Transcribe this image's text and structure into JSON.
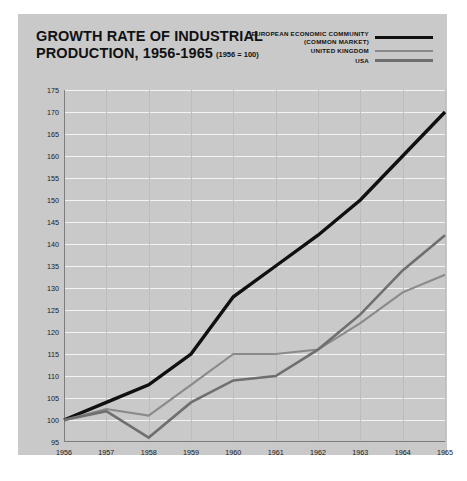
{
  "card": {
    "background": "#c9c9c9",
    "page_background": "#ffffff"
  },
  "title": {
    "line1": "GROWTH RATE OF INDUSTRIAL",
    "line2": "PRODUCTION, 1956-1965",
    "base_note": "(1956 = 100)"
  },
  "legend": {
    "position": "top-right",
    "items": [
      {
        "label": "EUROPEAN ECONOMIC COMMUNITY\n(COMMON MARKET)",
        "color": "#101010",
        "thickness": 3.4
      },
      {
        "label": "UNITED KINGDOM",
        "color": "#8a8a8a",
        "thickness": 2.1
      },
      {
        "label": "USA",
        "color": "#6f6f6f",
        "thickness": 2.6
      }
    ]
  },
  "axes": {
    "y_ticks": [
      175,
      170,
      165,
      160,
      155,
      150,
      145,
      140,
      135,
      130,
      125,
      120,
      115,
      110,
      105,
      100,
      95
    ],
    "x_ticks": [
      "1956",
      "1957",
      "1958",
      "1959",
      "1960",
      "1961",
      "1962",
      "1963",
      "1964",
      "1965"
    ],
    "ylim": [
      95,
      175
    ],
    "grid_color": "#f4f4f4",
    "vline_color": "#bdbdbd",
    "axis_color": "#7d7d7d"
  },
  "chart_data": {
    "type": "line",
    "title": "GROWTH RATE OF INDUSTRIAL PRODUCTION, 1956-1965",
    "subtitle": "(1956 = 100)",
    "xlabel": "",
    "ylabel": "",
    "ylim": [
      95,
      175
    ],
    "grid": true,
    "legend_position": "top-right",
    "categories": [
      "1956",
      "1957",
      "1958",
      "1959",
      "1960",
      "1961",
      "1962",
      "1963",
      "1964",
      "1965"
    ],
    "series": [
      {
        "name": "EUROPEAN ECONOMIC COMMUNITY (COMMON MARKET)",
        "color": "#101010",
        "values": [
          100,
          104,
          108,
          115,
          128,
          135,
          142,
          150,
          160,
          170
        ]
      },
      {
        "name": "UNITED KINGDOM",
        "color": "#8a8a8a",
        "values": [
          100,
          102.5,
          101,
          108,
          115,
          115,
          116,
          122,
          129,
          133
        ]
      },
      {
        "name": "USA",
        "color": "#6f6f6f",
        "values": [
          100,
          102,
          96,
          104,
          109,
          110,
          116,
          124,
          134,
          142
        ]
      }
    ]
  }
}
